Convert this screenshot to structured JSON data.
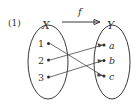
{
  "figure": {
    "number": "(1)",
    "map_label": "f",
    "domain_label": "X",
    "codomain_label": "Y",
    "domain_elements": [
      "1",
      "2",
      "3"
    ],
    "codomain_elements": [
      "a",
      "b",
      "c"
    ],
    "mappings": [
      {
        "from": "1",
        "to": "c"
      },
      {
        "from": "2",
        "to": "a"
      },
      {
        "from": "3",
        "to": "b"
      }
    ],
    "colors": {
      "ink": "#33312f",
      "line": "#3b3937",
      "edge": "#4a4846",
      "background": "#ffffff"
    }
  }
}
